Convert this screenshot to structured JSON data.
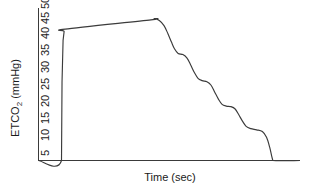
{
  "chart_data": {
    "type": "line",
    "title": "",
    "subtitle": "",
    "xlabel": "Time (sec)",
    "ylabel": "ETCO2 (mmHg)",
    "ylabel_main": "ETCO",
    "ylabel_subscript": "2",
    "ylabel_units": " (mmHg)",
    "yticks": [
      5,
      10,
      15,
      20,
      25,
      30,
      35,
      40,
      45,
      50
    ],
    "ytick_labels": [
      "5",
      "10",
      "15",
      "20",
      "25",
      "30",
      "35",
      "40",
      "45",
      "50"
    ],
    "ylim": [
      0,
      52
    ],
    "xlim": [
      0,
      10
    ],
    "xticks": [],
    "xtick_labels": [],
    "grid": false,
    "legend": null,
    "annotations": [],
    "line_color": "#3b3b3b",
    "axis_color": "#3a3a3a",
    "background_color": "#ffffff",
    "series": [
      {
        "name": "ETCO2 waveform",
        "description": "Capnography expiratory waveform with steep upstroke, upward-sloping alveolar plateau, and an oscillating stepped descent before returning to baseline",
        "points": [
          [
            0.0,
            0.0
          ],
          [
            0.88,
            0.0
          ],
          [
            0.9,
            27.0
          ],
          [
            0.94,
            41.5
          ],
          [
            0.98,
            44.6
          ],
          [
            1.02,
            45.4
          ],
          [
            4.3,
            48.6
          ],
          [
            4.42,
            49.0
          ],
          [
            4.62,
            48.4
          ],
          [
            4.8,
            46.6
          ],
          [
            4.95,
            43.8
          ],
          [
            5.08,
            41.0
          ],
          [
            5.2,
            38.6
          ],
          [
            5.34,
            37.0
          ],
          [
            5.52,
            36.6
          ],
          [
            5.68,
            35.4
          ],
          [
            5.82,
            33.0
          ],
          [
            5.96,
            30.4
          ],
          [
            6.1,
            28.4
          ],
          [
            6.26,
            27.6
          ],
          [
            6.44,
            27.2
          ],
          [
            6.6,
            26.0
          ],
          [
            6.74,
            23.6
          ],
          [
            6.88,
            21.2
          ],
          [
            7.02,
            19.4
          ],
          [
            7.18,
            18.8
          ],
          [
            7.36,
            18.6
          ],
          [
            7.52,
            17.8
          ],
          [
            7.66,
            15.8
          ],
          [
            7.8,
            13.6
          ],
          [
            7.94,
            11.8
          ],
          [
            8.12,
            11.0
          ],
          [
            8.34,
            10.6
          ],
          [
            8.56,
            10.0
          ],
          [
            8.72,
            8.0
          ],
          [
            8.84,
            4.6
          ],
          [
            8.92,
            1.4
          ],
          [
            8.96,
            0.0
          ],
          [
            10.0,
            0.0
          ]
        ]
      }
    ]
  },
  "axes": {
    "y_axis_name": "etco2-axis",
    "x_axis_name": "time-axis"
  }
}
